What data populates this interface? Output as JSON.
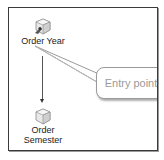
{
  "diagram": {
    "nodes": [
      {
        "id": "order-year",
        "label": "Order Year",
        "icon": "cube-attribute-key-icon"
      },
      {
        "id": "order-semester",
        "label_line1": "Order",
        "label_line2": "Semester",
        "icon": "cube-attribute-icon"
      }
    ],
    "edges": [
      {
        "from": "order-year",
        "to": "order-semester",
        "type": "arrow"
      }
    ],
    "callout": {
      "text": "Entry point",
      "points_to": "order-year"
    }
  },
  "colors": {
    "frame_border": "#3a3a3a",
    "callout_border": "#9a9a9a",
    "callout_text": "#9a9a9a",
    "arrow": "#555555"
  }
}
